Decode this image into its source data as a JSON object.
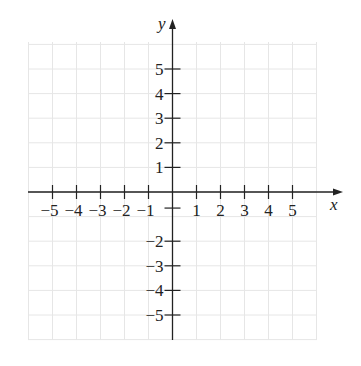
{
  "chart_data": {
    "type": "coordinate-plane",
    "title": "",
    "xlabel": "x",
    "ylabel": "y",
    "xlim": [
      -6,
      6
    ],
    "ylim": [
      -6,
      6
    ],
    "grid": true,
    "x_ticks": [
      -5,
      -4,
      -3,
      -2,
      -1,
      1,
      2,
      3,
      4,
      5
    ],
    "y_ticks": [
      5,
      4,
      3,
      2,
      1,
      -2,
      -3,
      -4,
      -5
    ],
    "x_tick_labels": [
      "−5",
      "−4",
      "−3",
      "−2",
      "−1",
      "1",
      "2",
      "3",
      "4",
      "5"
    ],
    "y_tick_labels": [
      "5",
      "4",
      "3",
      "2",
      "1",
      "−2",
      "−3",
      "−4",
      "−5"
    ],
    "series": []
  },
  "colors": {
    "axis": "#222222",
    "grid": "#e6e6e6",
    "background": "#ffffff"
  }
}
